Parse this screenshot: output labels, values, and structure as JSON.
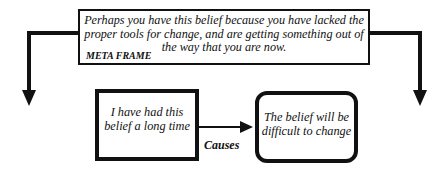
{
  "diagram": {
    "meta_frame": {
      "text": "Perhaps you have this belief because you have lacked the proper tools for change, and are getting something out of the way that you are now.",
      "label": "META FRAME"
    },
    "cause_box": {
      "text": "I have had this belief a long time"
    },
    "effect_box": {
      "text": "The belief will be difficult to change"
    },
    "relation_label": "Causes"
  }
}
